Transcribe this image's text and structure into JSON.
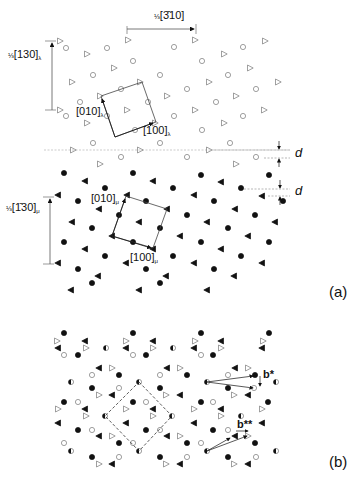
{
  "figure": {
    "panel_a_label": "(a)",
    "panel_b_label": "(b)",
    "lambda_lattice": {
      "vector_horizontal": {
        "frac": "⅓",
        "index": "[3̄10]"
      },
      "vector_vertical": {
        "frac": "⅓",
        "index": "[130]",
        "sub": "λ"
      },
      "cell_axis_010": {
        "index": "[010]",
        "sub": "λ"
      },
      "cell_axis_100": {
        "index": "[100]",
        "sub": "λ"
      },
      "spacing_label": "d",
      "symbols": [
        "open-circle",
        "open-triangle"
      ]
    },
    "mu_lattice": {
      "vector_vertical": {
        "frac": "⅓",
        "index": "[1̄30]",
        "sub": "μ"
      },
      "cell_axis_010": {
        "index": "[010]",
        "sub": "μ"
      },
      "cell_axis_100": {
        "index": "[100]",
        "sub": "μ"
      },
      "spacing_label": "d",
      "symbols": [
        "filled-circle",
        "filled-triangle"
      ]
    },
    "superposition": {
      "vector_b_star": "b*",
      "vector_b_star_star": "b**",
      "symbols": [
        "open-circle",
        "open-triangle",
        "filled-circle",
        "filled-triangle",
        "half-filled-circle"
      ]
    }
  }
}
